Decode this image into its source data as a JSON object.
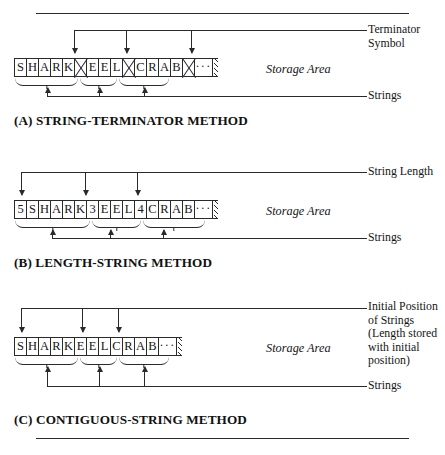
{
  "figure": {
    "storage_area_label": "Storage Area",
    "ellipsis": "···"
  },
  "panels": [
    {
      "id": "a",
      "caption": "(A) STRING-TERMINATOR METHOD",
      "top_label": "Terminator\nSymbol",
      "bottom_label": "Strings",
      "storage_area_label": "Storage Area",
      "cells": [
        "S",
        "H",
        "A",
        "R",
        "K",
        "☒",
        "E",
        "E",
        "L",
        "☒",
        "C",
        "R",
        "A",
        "B",
        "☒",
        "···"
      ],
      "strings": [
        "SHARK",
        "EEL",
        "CRAB"
      ],
      "terminator_count": 3
    },
    {
      "id": "b",
      "caption": "(B) LENGTH-STRING METHOD",
      "top_label": "String Length",
      "bottom_label": "Strings",
      "storage_area_label": "Storage Area",
      "cells": [
        "5",
        "S",
        "H",
        "A",
        "R",
        "K",
        "3",
        "E",
        "E",
        "L",
        "4",
        "C",
        "R",
        "A",
        "B",
        "···"
      ],
      "strings": [
        "SHARK",
        "EEL",
        "CRAB"
      ],
      "lengths": [
        "5",
        "3",
        "4"
      ]
    },
    {
      "id": "c",
      "caption": "(C) CONTIGUOUS-STRING METHOD",
      "top_label": "Initial Position\nof Strings\n(Length stored\nwith initial\nposition)",
      "bottom_label": "Strings",
      "storage_area_label": "Storage Area",
      "cells": [
        "S",
        "H",
        "A",
        "R",
        "K",
        "E",
        "E",
        "L",
        "C",
        "R",
        "A",
        "B",
        "···"
      ],
      "strings": [
        "SHARK",
        "EEL",
        "CRAB"
      ]
    }
  ]
}
